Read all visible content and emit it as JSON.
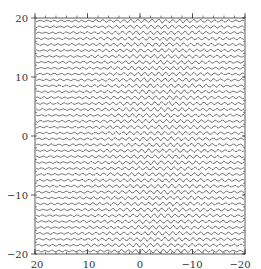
{
  "chart_data": {
    "type": "line",
    "title": "",
    "xlabel": "",
    "ylabel": "",
    "xlim": [
      20,
      -20
    ],
    "ylim": [
      -20,
      20
    ],
    "x_reversed": true,
    "x_ticks": [
      20,
      10,
      0,
      -10,
      -20
    ],
    "x_tick_labels": [
      "20",
      "10",
      "0",
      "−10",
      "−20"
    ],
    "y_ticks": [
      20,
      10,
      0,
      -10,
      -20
    ],
    "y_tick_labels": [
      "20",
      "10",
      "0",
      "−10",
      "−20"
    ],
    "num_traces": 40,
    "trace_spacing": 1.0,
    "grid": false,
    "legend": null,
    "line_color": "#222222"
  },
  "axes": {
    "x_labels": [
      "20",
      "10",
      "0",
      "−10",
      "−20"
    ],
    "y_labels": [
      "20",
      "10",
      "0",
      "−10",
      "−20"
    ]
  }
}
